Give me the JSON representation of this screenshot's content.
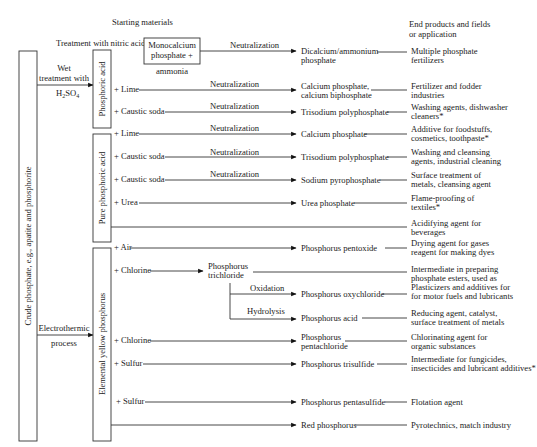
{
  "headers": {
    "starting_materials": "Starting materials",
    "end_products_line1": "End products and fields",
    "end_products_line2": "or application"
  },
  "source": {
    "label": "Crude phosphate, e.g., apatite and phosphorite"
  },
  "processes": {
    "wet_line1": "Wet",
    "wet_line2": "treatment with",
    "wet_acid": "H",
    "wet_acid_sub1": "2",
    "wet_acid_mid": "SO",
    "wet_acid_sub2": "4",
    "electro_line1": "Electrothermic",
    "electro_line2": "process",
    "nitric": "Treatment with nitric acid"
  },
  "intermediates": {
    "phosphoric_acid": "Phosphoric acid",
    "pure_phosphoric_acid": "Pure phosphoric acid",
    "yellow_phosphorus": "Elemental yellow phosphorus",
    "monocalcium_line1": "Monocalcium",
    "monocalcium_line2": "phosphate +",
    "ammonia": "ammonia"
  },
  "operations": {
    "neutralization": "Neutralization",
    "oxidation": "Oxidation",
    "hydrolysis": "Hydrolysis"
  },
  "rows": [
    {
      "reagent": "",
      "process": "Neutralization",
      "product": [
        "Dicalcium/ammonium",
        "phosphate"
      ],
      "application": [
        "Multiple phosphate",
        "fertilizers"
      ]
    },
    {
      "reagent": "+ Lime",
      "process": "Neutralization",
      "product": [
        "Calcium phosphate,",
        "calcium biphosphate"
      ],
      "application": [
        "Fertilizer and fodder",
        "industries"
      ]
    },
    {
      "reagent": "+ Caustic soda",
      "process": "Neutralization",
      "product": [
        "Trisodium polyphosphate"
      ],
      "application": [
        "Washing agents, dishwasher",
        "cleaners*"
      ]
    },
    {
      "reagent": "+ Lime",
      "process": "Neutralization",
      "product": [
        "Calcium phosphate"
      ],
      "application": [
        "Additive for foodstuffs,",
        "cosmetics, toothpaste*"
      ]
    },
    {
      "reagent": "+ Caustic soda",
      "process": "Neutralization",
      "product": [
        "Trisodium polyphosphate"
      ],
      "application": [
        "Washing and cleansing",
        "agents, industrial cleaning"
      ]
    },
    {
      "reagent": "+ Caustic soda",
      "process": "Neutralization",
      "product": [
        "Sodium pyrophosphate"
      ],
      "application": [
        "Surface treatment of",
        "metals, cleansing agent"
      ]
    },
    {
      "reagent": "+ Urea",
      "process": "",
      "product": [
        "Urea phosphate"
      ],
      "application": [
        "Flame-proofing of",
        "textiles*"
      ]
    },
    {
      "reagent": "",
      "process": "",
      "product": [],
      "application": [
        "Acidifying agent for",
        "beverages"
      ]
    },
    {
      "reagent": "+ Air",
      "process": "",
      "product": [
        "Phosphorus pentoxide"
      ],
      "application": [
        "Drying agent for gases",
        "reagent for making dyes"
      ]
    },
    {
      "reagent": "+ Chlorine",
      "process": "",
      "product": [
        "Phosphorus",
        "trichloride"
      ],
      "application": [
        "Intermediate in preparing",
        "phosphate esters, used as",
        "Plasticizers and additives for",
        "for motor fuels and lubricants"
      ]
    },
    {
      "reagent": "",
      "process": "Oxidation",
      "product": [
        "Phosphorus oxychloride"
      ],
      "application": []
    },
    {
      "reagent": "",
      "process": "Hydrolysis",
      "product": [
        "Phosphorus acid"
      ],
      "application": [
        "Reducing agent, catalyst,",
        "surface treatment of metals"
      ]
    },
    {
      "reagent": "+ Chlorine",
      "process": "",
      "product": [
        "Phosphorus",
        "pentachloride"
      ],
      "application": [
        "Chlorinating agent for",
        "organic substances"
      ]
    },
    {
      "reagent": "+ Sulfur",
      "process": "",
      "product": [
        "Phosphorus trisulfide"
      ],
      "application": [
        "Intermediate for fungicides,",
        "insecticides and lubricant additives*"
      ]
    },
    {
      "reagent": "+ Sulfur",
      "process": "",
      "product": [
        "Phosphorus pentasulfide"
      ],
      "application": [
        "Flotation agent"
      ]
    },
    {
      "reagent": "",
      "process": "",
      "product": [
        "Red phosphorus"
      ],
      "application": [
        "Pyrotechnics, match industry"
      ]
    }
  ]
}
